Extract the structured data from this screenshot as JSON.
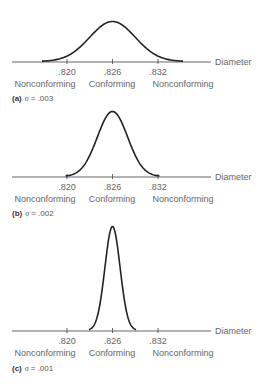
{
  "chart_data": [
    {
      "type": "line",
      "panel": "a",
      "title": "(a) σ = .003",
      "caption_letter": "(a)",
      "caption_text": "= .003",
      "sigma": 0.003,
      "mean": 0.826,
      "xlabel": "Diameter",
      "ticks": [
        ".820",
        ".826",
        ".832"
      ],
      "tick_values": [
        0.82,
        0.826,
        0.832
      ],
      "regions": [
        "Nonconforming",
        "Conforming",
        "Nonconforming"
      ],
      "axis_y": 62,
      "peak_y": 22,
      "caption_y": 101
    },
    {
      "type": "line",
      "panel": "b",
      "title": "(b) σ = .002",
      "caption_letter": "(b)",
      "caption_text": "= .002",
      "sigma": 0.002,
      "mean": 0.826,
      "xlabel": "Diameter",
      "ticks": [
        ".820",
        ".826",
        ".832"
      ],
      "tick_values": [
        0.82,
        0.826,
        0.832
      ],
      "regions": [
        "Nonconforming",
        "Conforming",
        "Nonconforming"
      ],
      "axis_y": 177,
      "peak_y": 112,
      "caption_y": 216
    },
    {
      "type": "line",
      "panel": "c",
      "title": "(c) σ = .001",
      "caption_letter": "(c)",
      "caption_text": "= .001",
      "sigma": 0.001,
      "mean": 0.826,
      "xlabel": "Diameter",
      "ticks": [
        ".820",
        ".826",
        ".832"
      ],
      "tick_values": [
        0.82,
        0.826,
        0.832
      ],
      "regions": [
        "Nonconforming",
        "Conforming",
        "Nonconforming"
      ],
      "axis_y": 331,
      "peak_y": 227,
      "caption_y": 371
    }
  ],
  "colors": {
    "curve": "#222222",
    "axis": "#555555",
    "text": "#666666"
  }
}
